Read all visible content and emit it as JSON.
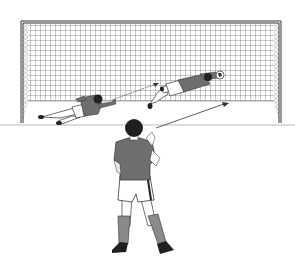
{
  "illustration": {
    "subject": "Penalty kick scene",
    "description": "Penalty taker viewed from behind facing a goal; goalkeeper diving shown in two sequential positions with motion arrows",
    "colors": {
      "background": "#ffffff",
      "line": "#333333",
      "jersey": "#6e6e6e",
      "socks": "#8a8a8a",
      "hair": "#1f1f1f",
      "net": "#555555",
      "shorts": "#ffffff"
    },
    "elements": {
      "goal": "goal-frame-with-net",
      "goalkeeper_positions": 2,
      "arrows": 2,
      "penalty_taker": "player-back-view"
    }
  }
}
